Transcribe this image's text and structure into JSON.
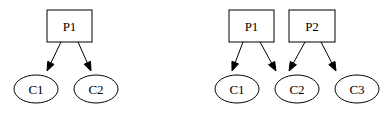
{
  "diagram": {
    "background": "#ffffff",
    "stroke_color": "#000000",
    "graphs": [
      {
        "id": "left",
        "nodes": [
          {
            "id": "P1",
            "label": "P1",
            "shape": "box",
            "x": 47,
            "y": 10,
            "w": 45,
            "h": 32
          },
          {
            "id": "C1",
            "label": "C1",
            "shape": "ellipse",
            "cx": 36,
            "cy": 89,
            "rx": 22,
            "ry": 14
          },
          {
            "id": "C2",
            "label": "C2",
            "shape": "ellipse",
            "cx": 96,
            "cy": 89,
            "rx": 22,
            "ry": 14
          }
        ],
        "edges": [
          {
            "from": "P1",
            "to": "C1",
            "x1": 61,
            "y1": 42,
            "x2": 47,
            "y2": 71
          },
          {
            "from": "P1",
            "to": "C2",
            "x1": 78,
            "y1": 42,
            "x2": 91,
            "y2": 71
          }
        ]
      },
      {
        "id": "right",
        "nodes": [
          {
            "id": "P1",
            "label": "P1",
            "shape": "box",
            "x": 229,
            "y": 10,
            "w": 45,
            "h": 32
          },
          {
            "id": "P2",
            "label": "P2",
            "shape": "box",
            "x": 289,
            "y": 10,
            "w": 46,
            "h": 32
          },
          {
            "id": "C1",
            "label": "C1",
            "shape": "ellipse",
            "cx": 237,
            "cy": 89,
            "rx": 22,
            "ry": 14
          },
          {
            "id": "C2",
            "label": "C2",
            "shape": "ellipse",
            "cx": 297,
            "cy": 89,
            "rx": 22,
            "ry": 14
          },
          {
            "id": "C3",
            "label": "C3",
            "shape": "ellipse",
            "cx": 357,
            "cy": 89,
            "rx": 22,
            "ry": 14
          }
        ],
        "edges": [
          {
            "from": "P1",
            "to": "C1",
            "x1": 243,
            "y1": 42,
            "x2": 232,
            "y2": 71
          },
          {
            "from": "P1",
            "to": "C2",
            "x1": 260,
            "y1": 42,
            "x2": 276,
            "y2": 71
          },
          {
            "from": "P2",
            "to": "C2",
            "x1": 305,
            "y1": 42,
            "x2": 289,
            "y2": 71
          },
          {
            "from": "P2",
            "to": "C3",
            "x1": 321,
            "y1": 42,
            "x2": 336,
            "y2": 71
          }
        ]
      }
    ]
  }
}
